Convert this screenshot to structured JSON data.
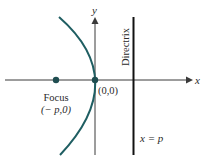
{
  "diagram": {
    "colors": {
      "curve": "#1f5e62",
      "axis": "#3a3a3a",
      "directrix": "#111111",
      "text": "#2a2a2a"
    },
    "axes": {
      "x_label": "x",
      "y_label": "y"
    },
    "directrix": {
      "label": "Directrix",
      "equation": "x = p"
    },
    "points": {
      "focus": {
        "label": "Focus",
        "coords": "(− p,0)"
      },
      "vertex": {
        "coords": "(0,0)"
      }
    }
  }
}
